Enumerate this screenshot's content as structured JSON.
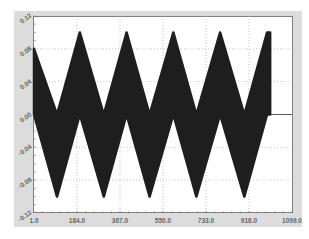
{
  "chart_data": {
    "type": "area",
    "title": "",
    "xlabel": "",
    "ylabel": "",
    "xlim": [
      1.0,
      1099.0
    ],
    "ylim": [
      -0.12,
      0.12
    ],
    "grid": true,
    "legend": null,
    "x_ticks": [
      "1.0",
      "184.0",
      "367.0",
      "550.0",
      "733.0",
      "916.0",
      "1099.0"
    ],
    "y_ticks": [
      "0.12",
      "0.08",
      "0.04",
      "0.00",
      "-0.04",
      "-0.08",
      "-0.12"
    ],
    "series": [
      {
        "name": "upper_envelope",
        "x": [
          1,
          99,
          196,
          298,
          395,
          493,
          594,
          692,
          793,
          896,
          993,
          1006
        ],
        "values": [
          0.08,
          0.0,
          0.1,
          0.0,
          0.1,
          0.0,
          0.1,
          0.0,
          0.1,
          0.0,
          0.1,
          0.1
        ]
      },
      {
        "name": "lower_envelope",
        "x": [
          1,
          99,
          196,
          298,
          395,
          493,
          594,
          692,
          793,
          896,
          993,
          1006
        ],
        "values": [
          0.0,
          -0.1,
          0.0,
          -0.1,
          0.0,
          -0.1,
          0.0,
          -0.1,
          0.0,
          -0.1,
          0.0,
          0.0
        ]
      },
      {
        "name": "tail",
        "x": [
          1006,
          1099
        ],
        "values": [
          0.0,
          0.0
        ]
      }
    ],
    "color": "#1e1e1e"
  }
}
